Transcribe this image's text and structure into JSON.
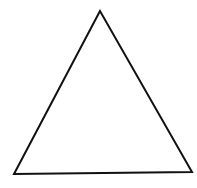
{
  "diagram": {
    "shape": "triangle",
    "stroke_color": "#111111",
    "fill_color": "none",
    "stroke_width": 2,
    "vertices": {
      "apex": [
        100,
        11
      ],
      "bottom_left": [
        14,
        174
      ],
      "bottom_right": [
        192,
        172
      ]
    }
  }
}
